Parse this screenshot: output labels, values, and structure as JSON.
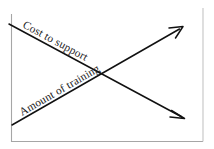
{
  "diagram": {
    "background_color": "#ffffff",
    "frame": {
      "name": "open-axis-frame",
      "border_color": "#a6a6a6",
      "right_border_color": "#c4c4c4",
      "left_x": 11,
      "right_x": 203,
      "bottom_y": 141,
      "top_open": true
    },
    "lines": [
      {
        "id": "cost-to-support",
        "label": "Cost to support",
        "direction": "descending",
        "color": "#111111",
        "start": {
          "x": 9,
          "y": 24
        },
        "end": {
          "x": 184,
          "y": 118
        },
        "arrow_at": "end",
        "label_angle": 28.3,
        "label_x": 22,
        "label_y": 27
      },
      {
        "id": "amount-of-training",
        "label": "Amount of training",
        "direction": "ascending",
        "color": "#111111",
        "start": {
          "x": 12,
          "y": 125
        },
        "end": {
          "x": 182,
          "y": 27
        },
        "arrow_at": "end",
        "label_angle": -30.0,
        "label_x": 22,
        "label_y": 116
      }
    ],
    "intersection": {
      "x": 100,
      "y": 73
    }
  }
}
